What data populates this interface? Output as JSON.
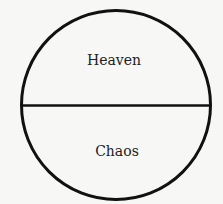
{
  "diagram": {
    "top_label": "Heaven",
    "bottom_label": "Chaos",
    "colors": {
      "stroke": "#111111",
      "text": "#222222",
      "background": "#f7f7f5"
    }
  }
}
